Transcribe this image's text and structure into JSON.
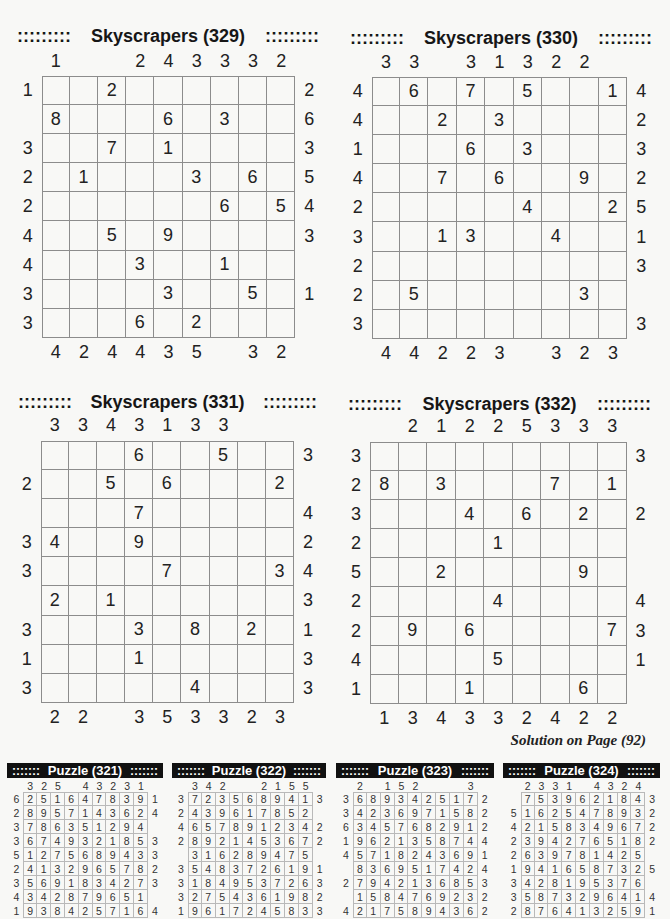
{
  "page": {
    "solution_note": "Solution on Page (92)"
  },
  "puzzles": [
    {
      "title": "Skyscrapers (329)",
      "decor_left": ":::::::::",
      "decor_right": ":::::::::",
      "top": [
        "1",
        "",
        "",
        "2",
        "4",
        "3",
        "3",
        "3",
        "2"
      ],
      "bottom": [
        "4",
        "2",
        "4",
        "4",
        "3",
        "5",
        "",
        "3",
        "2"
      ],
      "left": [
        "1",
        "",
        "3",
        "2",
        "2",
        "4",
        "4",
        "3",
        "3"
      ],
      "right": [
        "2",
        "6",
        "3",
        "5",
        "4",
        "3",
        "",
        "1",
        ""
      ],
      "grid": [
        [
          "",
          "",
          "2",
          "",
          "",
          "",
          "",
          "",
          ""
        ],
        [
          "8",
          "",
          "",
          "",
          "6",
          "",
          "3",
          "",
          ""
        ],
        [
          "",
          "",
          "7",
          "",
          "1",
          "",
          "",
          "",
          ""
        ],
        [
          "",
          "1",
          "",
          "",
          "",
          "3",
          "",
          "6",
          ""
        ],
        [
          "",
          "",
          "",
          "",
          "",
          "",
          "6",
          "",
          "5"
        ],
        [
          "",
          "",
          "5",
          "",
          "9",
          "",
          "",
          "",
          ""
        ],
        [
          "",
          "",
          "",
          "3",
          "",
          "",
          "1",
          "",
          ""
        ],
        [
          "",
          "",
          "",
          "",
          "3",
          "",
          "",
          "5",
          ""
        ],
        [
          "",
          "",
          "",
          "6",
          "",
          "2",
          "",
          "",
          ""
        ]
      ]
    },
    {
      "title": "Skyscrapers (330)",
      "decor_left": ":::::::::",
      "decor_right": ":::::::::",
      "top": [
        "3",
        "3",
        "",
        "3",
        "1",
        "3",
        "2",
        "2",
        ""
      ],
      "bottom": [
        "4",
        "4",
        "2",
        "2",
        "3",
        "",
        "3",
        "2",
        "3"
      ],
      "left": [
        "4",
        "4",
        "1",
        "4",
        "2",
        "3",
        "2",
        "2",
        "3"
      ],
      "right": [
        "4",
        "2",
        "3",
        "2",
        "5",
        "1",
        "3",
        "",
        "3"
      ],
      "grid": [
        [
          "",
          "6",
          "",
          "7",
          "",
          "5",
          "",
          "",
          "1"
        ],
        [
          "",
          "",
          "2",
          "",
          "3",
          "",
          "",
          "",
          ""
        ],
        [
          "",
          "",
          "",
          "6",
          "",
          "3",
          "",
          "",
          ""
        ],
        [
          "",
          "",
          "7",
          "",
          "6",
          "",
          "",
          "9",
          ""
        ],
        [
          "",
          "",
          "",
          "",
          "",
          "4",
          "",
          "",
          "2"
        ],
        [
          "",
          "",
          "1",
          "3",
          "",
          "",
          "4",
          "",
          ""
        ],
        [
          "",
          "",
          "",
          "",
          "",
          "",
          "",
          "",
          ""
        ],
        [
          "",
          "5",
          "",
          "",
          "",
          "",
          "",
          "3",
          ""
        ],
        [
          "",
          "",
          "",
          "",
          "",
          "",
          "",
          "",
          ""
        ]
      ]
    },
    {
      "title": "Skyscrapers (331)",
      "decor_left": ":::::::::",
      "decor_right": ":::::::::",
      "top": [
        "3",
        "3",
        "4",
        "3",
        "1",
        "3",
        "3",
        "",
        ""
      ],
      "bottom": [
        "2",
        "2",
        "",
        "3",
        "5",
        "3",
        "3",
        "2",
        "3"
      ],
      "left": [
        "",
        "2",
        "",
        "3",
        "3",
        "",
        "3",
        "1",
        "3"
      ],
      "right": [
        "3",
        "",
        "4",
        "2",
        "4",
        "3",
        "1",
        "3",
        "3"
      ],
      "grid": [
        [
          "",
          "",
          "",
          "6",
          "",
          "",
          "5",
          "",
          ""
        ],
        [
          "",
          "",
          "5",
          "",
          "6",
          "",
          "",
          "",
          "2"
        ],
        [
          "",
          "",
          "",
          "7",
          "",
          "",
          "",
          "",
          ""
        ],
        [
          "4",
          "",
          "",
          "9",
          "",
          "",
          "",
          "",
          ""
        ],
        [
          "",
          "",
          "",
          "",
          "7",
          "",
          "",
          "",
          "3"
        ],
        [
          "2",
          "",
          "1",
          "",
          "",
          "",
          "",
          "",
          ""
        ],
        [
          "",
          "",
          "",
          "3",
          "",
          "8",
          "",
          "2",
          ""
        ],
        [
          "",
          "",
          "",
          "1",
          "",
          "",
          "",
          "",
          ""
        ],
        [
          "",
          "",
          "",
          "",
          "",
          "4",
          "",
          "",
          ""
        ]
      ]
    },
    {
      "title": "Skyscrapers (332)",
      "decor_left": ":::::::::",
      "decor_right": ":::::::::",
      "top": [
        "",
        "2",
        "1",
        "2",
        "2",
        "5",
        "3",
        "3",
        "3"
      ],
      "bottom": [
        "1",
        "3",
        "4",
        "3",
        "3",
        "2",
        "4",
        "2",
        "2"
      ],
      "left": [
        "3",
        "2",
        "3",
        "2",
        "5",
        "2",
        "2",
        "4",
        "1"
      ],
      "right": [
        "3",
        "",
        "2",
        "",
        "",
        "4",
        "3",
        "1",
        ""
      ],
      "grid": [
        [
          "",
          "",
          "",
          "",
          "",
          "",
          "",
          "",
          ""
        ],
        [
          "8",
          "",
          "3",
          "",
          "",
          "",
          "7",
          "",
          "1"
        ],
        [
          "",
          "",
          "",
          "4",
          "",
          "6",
          "",
          "2",
          ""
        ],
        [
          "",
          "",
          "",
          "",
          "1",
          "",
          "",
          "",
          ""
        ],
        [
          "",
          "",
          "2",
          "",
          "",
          "",
          "",
          "9",
          ""
        ],
        [
          "",
          "",
          "",
          "",
          "4",
          "",
          "",
          "",
          ""
        ],
        [
          "",
          "9",
          "",
          "6",
          "",
          "",
          "",
          "",
          "7"
        ],
        [
          "",
          "",
          "",
          "",
          "5",
          "",
          "",
          "",
          ""
        ],
        [
          "",
          "",
          "",
          "1",
          "",
          "",
          "",
          "6",
          ""
        ]
      ]
    }
  ],
  "solutions": [
    {
      "title": "Puzzle (321)",
      "decor_left": ":::::::",
      "decor_right": ":::::::",
      "top": [
        "3",
        "2",
        "5",
        "",
        "4",
        "3",
        "2",
        "3",
        "1"
      ],
      "left": [
        "6",
        "2",
        "3",
        "3",
        "5",
        "2",
        "3",
        "4",
        "1"
      ],
      "right": [
        "1",
        "4",
        "",
        "3",
        "3",
        "2",
        "3",
        "",
        "4"
      ],
      "grid": [
        [
          "2",
          "5",
          "1",
          "6",
          "4",
          "7",
          "8",
          "3",
          "9"
        ],
        [
          "8",
          "9",
          "5",
          "7",
          "1",
          "4",
          "3",
          "6",
          "2"
        ],
        [
          "7",
          "8",
          "6",
          "3",
          "5",
          "1",
          "2",
          "9",
          "4"
        ],
        [
          "6",
          "7",
          "4",
          "9",
          "3",
          "2",
          "1",
          "8",
          "5"
        ],
        [
          "1",
          "2",
          "7",
          "5",
          "6",
          "8",
          "9",
          "4",
          "3"
        ],
        [
          "4",
          "1",
          "3",
          "2",
          "9",
          "6",
          "5",
          "7",
          "8"
        ],
        [
          "5",
          "6",
          "9",
          "1",
          "8",
          "3",
          "4",
          "2",
          "7"
        ],
        [
          "3",
          "4",
          "2",
          "8",
          "7",
          "9",
          "6",
          "5",
          "1"
        ],
        [
          "9",
          "3",
          "8",
          "4",
          "2",
          "5",
          "7",
          "1",
          "6"
        ]
      ]
    },
    {
      "title": "Puzzle (322)",
      "decor_left": ":::::::",
      "decor_right": ":::::::",
      "top": [
        "3",
        "4",
        "2",
        "",
        "",
        "2",
        "1",
        "5",
        "5"
      ],
      "left": [
        "3",
        "2",
        "4",
        "2",
        "",
        "3",
        "3",
        "3",
        "1"
      ],
      "right": [
        "3",
        "",
        "2",
        "2",
        "",
        "1",
        "3",
        "2",
        "3"
      ],
      "grid": [
        [
          "7",
          "2",
          "3",
          "5",
          "6",
          "8",
          "9",
          "4",
          "1"
        ],
        [
          "4",
          "3",
          "9",
          "6",
          "1",
          "7",
          "8",
          "5",
          "2"
        ],
        [
          "6",
          "5",
          "7",
          "8",
          "9",
          "1",
          "2",
          "3",
          "4"
        ],
        [
          "8",
          "9",
          "2",
          "1",
          "4",
          "5",
          "3",
          "6",
          "7"
        ],
        [
          "3",
          "1",
          "6",
          "2",
          "8",
          "9",
          "4",
          "7",
          "5"
        ],
        [
          "5",
          "4",
          "8",
          "3",
          "7",
          "2",
          "6",
          "1",
          "9"
        ],
        [
          "1",
          "8",
          "4",
          "9",
          "5",
          "3",
          "7",
          "2",
          "6"
        ],
        [
          "2",
          "7",
          "5",
          "4",
          "3",
          "6",
          "1",
          "9",
          "8"
        ],
        [
          "9",
          "6",
          "1",
          "7",
          "2",
          "4",
          "5",
          "8",
          "3"
        ]
      ]
    },
    {
      "title": "Puzzle (323)",
      "decor_left": ":::::::",
      "decor_right": ":::::::",
      "top": [
        "2",
        "",
        "1",
        "5",
        "2",
        "",
        "",
        "",
        "3"
      ],
      "left": [
        "3",
        "3",
        "6",
        "1",
        "4",
        "",
        "2",
        "",
        "4"
      ],
      "right": [
        "2",
        "2",
        "2",
        "4",
        "1",
        "4",
        "3",
        "2",
        "2"
      ],
      "grid": [
        [
          "6",
          "8",
          "9",
          "3",
          "4",
          "2",
          "5",
          "1",
          "7"
        ],
        [
          "4",
          "2",
          "3",
          "6",
          "9",
          "7",
          "1",
          "5",
          "8"
        ],
        [
          "3",
          "4",
          "5",
          "7",
          "6",
          "8",
          "2",
          "9",
          "1"
        ],
        [
          "9",
          "6",
          "2",
          "1",
          "3",
          "5",
          "8",
          "7",
          "4"
        ],
        [
          "5",
          "7",
          "1",
          "8",
          "2",
          "4",
          "3",
          "6",
          "9"
        ],
        [
          "8",
          "3",
          "6",
          "9",
          "5",
          "1",
          "7",
          "4",
          "2"
        ],
        [
          "7",
          "9",
          "4",
          "2",
          "1",
          "3",
          "6",
          "8",
          "5"
        ],
        [
          "1",
          "5",
          "8",
          "4",
          "7",
          "6",
          "9",
          "2",
          "3"
        ],
        [
          "2",
          "1",
          "7",
          "5",
          "8",
          "9",
          "4",
          "3",
          "6"
        ]
      ]
    },
    {
      "title": "Puzzle (324)",
      "decor_left": ":::::::",
      "decor_right": ":::::::",
      "top": [
        "2",
        "3",
        "3",
        "1",
        "",
        "4",
        "3",
        "2",
        "4"
      ],
      "left": [
        "",
        "5",
        "4",
        "2",
        "2",
        "1",
        "3",
        "3",
        "2"
      ],
      "right": [
        "3",
        "2",
        "2",
        "2",
        "",
        "5",
        "",
        "4",
        "1"
      ],
      "grid": [
        [
          "7",
          "5",
          "3",
          "9",
          "6",
          "2",
          "1",
          "8",
          "4"
        ],
        [
          "1",
          "6",
          "2",
          "5",
          "4",
          "7",
          "8",
          "9",
          "3"
        ],
        [
          "2",
          "1",
          "5",
          "8",
          "3",
          "4",
          "9",
          "6",
          "7"
        ],
        [
          "3",
          "9",
          "4",
          "2",
          "7",
          "6",
          "5",
          "1",
          "8"
        ],
        [
          "6",
          "3",
          "9",
          "7",
          "8",
          "1",
          "4",
          "2",
          "5"
        ],
        [
          "9",
          "4",
          "1",
          "6",
          "5",
          "8",
          "7",
          "3",
          "2"
        ],
        [
          "4",
          "2",
          "8",
          "1",
          "9",
          "5",
          "3",
          "7",
          "6"
        ],
        [
          "5",
          "8",
          "7",
          "3",
          "2",
          "9",
          "6",
          "4",
          "1"
        ],
        [
          "8",
          "7",
          "6",
          "4",
          "1",
          "3",
          "2",
          "5",
          "9"
        ]
      ]
    }
  ]
}
